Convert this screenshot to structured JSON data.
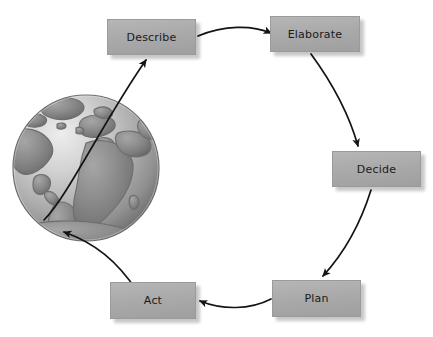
{
  "diagram": {
    "type": "cycle-diagram",
    "background_color": "#ffffff",
    "node_fill_color": "#ababab",
    "node_text_color": "#1a1a1a",
    "arrow_color": "#1a1a1a",
    "nodes": [
      {
        "id": "describe",
        "label": "Describe",
        "x": 107,
        "y": 19,
        "w": 89,
        "h": 36
      },
      {
        "id": "elaborate",
        "label": "Elaborate",
        "x": 270,
        "y": 16,
        "w": 90,
        "h": 36
      },
      {
        "id": "decide",
        "label": "Decide",
        "x": 332,
        "y": 151,
        "w": 89,
        "h": 36
      },
      {
        "id": "plan",
        "label": "Plan",
        "x": 272,
        "y": 280,
        "w": 89,
        "h": 37
      },
      {
        "id": "act",
        "label": "Act",
        "x": 110,
        "y": 282,
        "w": 86,
        "h": 37
      }
    ],
    "edges": [
      {
        "from": "globe",
        "to": "describe",
        "label": ""
      },
      {
        "from": "describe",
        "to": "elaborate",
        "label": ""
      },
      {
        "from": "elaborate",
        "to": "decide",
        "label": ""
      },
      {
        "from": "decide",
        "to": "plan",
        "label": ""
      },
      {
        "from": "plan",
        "to": "act",
        "label": ""
      },
      {
        "from": "act",
        "to": "globe",
        "label": ""
      }
    ],
    "globe": {
      "name": "earth-globe",
      "cx": 86,
      "cy": 168,
      "r": 73,
      "ocean_light": "#d8d8d8",
      "ocean_dark": "#8d8d8d",
      "land_color": "#8a8a8a",
      "land_outline": "#6f6f6f"
    }
  }
}
